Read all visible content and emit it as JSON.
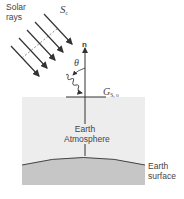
{
  "figure": {
    "labels": {
      "solar_rays": "Solar rays",
      "solar_constant": "S",
      "solar_constant_sub": "c",
      "normal": "n",
      "angle": "θ",
      "irradiation": "G",
      "irradiation_sub": "S, o",
      "atmosphere_line1": "Earth",
      "atmosphere_line2": "Atmosphere",
      "surface_line1": "Earth",
      "surface_line2": "surface"
    },
    "colors": {
      "atmosphere": "#ececec",
      "ground": "#c4c4c4",
      "lines": "#333333"
    }
  }
}
